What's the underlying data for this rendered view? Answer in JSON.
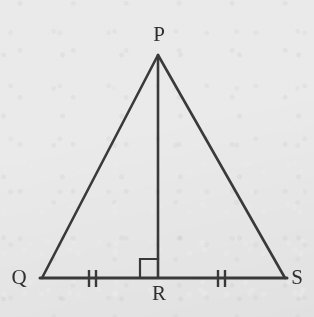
{
  "figure": {
    "background_color": "#e9eae9",
    "stroke_color": "#3a3a3a",
    "label_color": "#2f2f2f",
    "vertices": [
      {
        "name": "P",
        "label": "P",
        "x": 158,
        "y": 55,
        "label_x": 159,
        "label_y": 34
      },
      {
        "name": "Q",
        "label": "Q",
        "x": 42,
        "y": 278,
        "label_x": 19,
        "label_y": 277
      },
      {
        "name": "R",
        "label": "R",
        "x": 158,
        "y": 278,
        "label_x": 159,
        "label_y": 293
      },
      {
        "name": "S",
        "label": "S",
        "x": 285,
        "y": 278,
        "label_x": 297,
        "label_y": 277
      }
    ],
    "segments": [
      {
        "name": "side-PQ",
        "from": "P",
        "to": "Q"
      },
      {
        "name": "side-PS",
        "from": "P",
        "to": "S"
      },
      {
        "name": "base-QS",
        "from": "Q",
        "to": "S"
      },
      {
        "name": "altitude-PR",
        "from": "P",
        "to": "R"
      }
    ],
    "right_angle": {
      "at": "R",
      "side": "left",
      "size": 18
    },
    "congruence_ticks": [
      {
        "name": "tick-marks-QR",
        "segment": "QR",
        "count": 2,
        "center_x": 92,
        "center_y": 278
      },
      {
        "name": "tick-marks-RS",
        "segment": "RS",
        "count": 2,
        "center_x": 221,
        "center_y": 278
      }
    ]
  }
}
